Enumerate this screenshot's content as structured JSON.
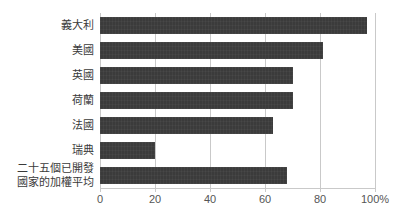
{
  "chart_data": {
    "type": "bar",
    "orientation": "horizontal",
    "title": "",
    "xlabel": "",
    "ylabel": "",
    "categories": [
      "義大利",
      "美國",
      "英國",
      "荷蘭",
      "法國",
      "瑞典",
      "二十五個已開發\n國家的加權平均"
    ],
    "values": [
      97,
      81,
      70,
      70,
      63,
      20,
      68
    ],
    "xlim": [
      0,
      100
    ],
    "xticks": [
      0,
      20,
      40,
      60,
      80,
      100
    ],
    "xtick_labels": [
      "0",
      "20",
      "40",
      "60",
      "80",
      "100%"
    ],
    "grid": true,
    "legend": false,
    "bar_color": "#3b3b3b",
    "gridline_color": "#c9c9c9",
    "axis_text_color": "#555555",
    "label_text_color": "#3a3a3a",
    "background_color": "#ffffff"
  }
}
